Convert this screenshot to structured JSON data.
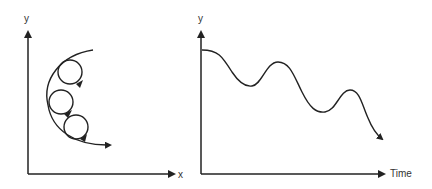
{
  "left_diagram": {
    "y_label": "y",
    "x_label": "x",
    "description": "Large arc path with three circular loops (cycloidal motion) along it",
    "loops": 3
  },
  "right_diagram": {
    "y_label": "y",
    "x_label": "Time",
    "description": "Damped decreasing oscillating curve over time ending in arrow"
  },
  "colors": {
    "line": "#222222",
    "background": "#ffffff"
  }
}
